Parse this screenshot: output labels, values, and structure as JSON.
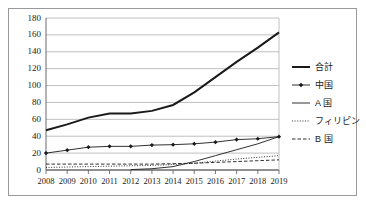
{
  "chart_data": {
    "type": "line",
    "title": "",
    "xlabel": "",
    "ylabel": "",
    "x": [
      2008,
      2009,
      2010,
      2011,
      2012,
      2013,
      2014,
      2015,
      2016,
      2017,
      2018,
      2019
    ],
    "xtick_labels": [
      "2008",
      "2009",
      "2010",
      "2011",
      "2012",
      "2013",
      "2014",
      "2015",
      "2016",
      "2017",
      "2018",
      "2019"
    ],
    "ytick_labels": [
      "0",
      "20",
      "40",
      "60",
      "80",
      "100",
      "120",
      "140",
      "160",
      "180"
    ],
    "ylim": [
      0,
      180
    ],
    "ytick_step": 20,
    "grid": "horizontal",
    "legend_position": "right",
    "series": [
      {
        "name": "合計",
        "style": "solid-thick",
        "marker": "none",
        "color": "#1a1a1a",
        "values": [
          47,
          54,
          62,
          67,
          67,
          70,
          77,
          92,
          110,
          128,
          145,
          163
        ]
      },
      {
        "name": "中国",
        "style": "solid-thin",
        "marker": "diamond",
        "color": "#1a1a1a",
        "values": [
          20,
          23.5,
          27,
          28,
          28,
          29.5,
          30,
          31,
          33,
          36,
          37,
          39.5
        ]
      },
      {
        "name": "A 国",
        "style": "solid-thin",
        "marker": "none",
        "color": "#1a1a1a",
        "values": [
          null,
          null,
          null,
          null,
          0.5,
          1.5,
          4,
          10,
          17,
          24,
          31,
          39.5
        ]
      },
      {
        "name": "フィリピン",
        "style": "dotted",
        "marker": "none",
        "color": "#1a1a1a",
        "values": [
          3,
          3.5,
          4,
          4.5,
          5,
          5.5,
          6.5,
          8,
          10.5,
          13,
          15,
          17
        ]
      },
      {
        "name": "B 国",
        "style": "dashed",
        "marker": "none",
        "color": "#1a1a1a",
        "values": [
          7,
          7,
          7,
          7,
          7,
          7,
          7.5,
          8,
          9,
          10,
          11,
          12
        ]
      }
    ]
  },
  "style": {
    "frame_border": "#9a9a9a",
    "axis_color": "#5a5a5a",
    "grid_color": "#b0b0b0",
    "line_color": "#1a1a1a",
    "text_color": "#1a1a1a",
    "background": "#ffffff"
  }
}
